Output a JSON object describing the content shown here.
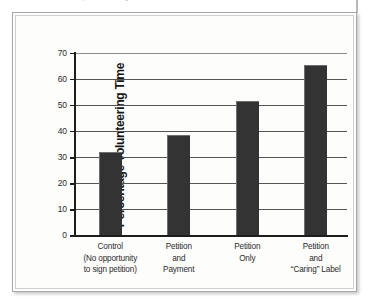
{
  "page": {
    "cut_caption": "decision, thereby undermining intrinsic motivation to volunteer",
    "background_color": "#ffffff"
  },
  "figure": {
    "frame_border_color": "#a8a8a8",
    "inner_border_color": "#cfcfcf",
    "plot_background": "#fdfdfc",
    "bar_color": "#333333",
    "axis_color": "#1d1d1d",
    "gridline_color": "#555555"
  },
  "chart_data": {
    "type": "bar",
    "title": "",
    "xlabel": "",
    "ylabel": "Percentage Volunteering Time",
    "ylim": [
      0,
      70
    ],
    "yticks": [
      0,
      10,
      20,
      30,
      40,
      50,
      60,
      70
    ],
    "ytick_labels": [
      "0",
      "10",
      "20",
      "30",
      "40",
      "50",
      "60",
      "70"
    ],
    "grid": true,
    "legend": false,
    "legend_position": "none",
    "orientation": "vertical",
    "categories": [
      "Control (No opportunity to sign petition)",
      "Petition and Payment",
      "Petition Only",
      "Petition and “Caring” Label"
    ],
    "category_lines": [
      [
        "Control",
        "(No opportunity",
        "to sign petition)"
      ],
      [
        "Petition",
        "and",
        "Payment"
      ],
      [
        "Petition",
        "Only"
      ],
      [
        "Petition",
        "and",
        "“Caring” Label"
      ]
    ],
    "values": [
      32,
      38.5,
      51.5,
      65.5
    ],
    "value_labels": [
      "32",
      "38.5",
      "51.5",
      "65.5"
    ]
  }
}
